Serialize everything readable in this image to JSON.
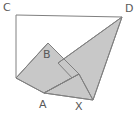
{
  "figure": {
    "background_color": "#ffffff",
    "fill_color": "#c8c8c8",
    "fill_color_dark": "#bdbdbd",
    "stroke_color": "#808080",
    "label_color": "#595959",
    "stroke_width": 1,
    "width": 139,
    "height": 120
  },
  "labels": {
    "c": "C",
    "d": "D",
    "a": "A",
    "b": "B",
    "x": "X"
  },
  "points": {
    "C": [
      16,
      15
    ],
    "D": [
      122,
      17
    ],
    "L": [
      16,
      78
    ],
    "B": [
      48,
      43
    ],
    "A": [
      44,
      93
    ],
    "X": [
      80,
      101
    ],
    "R": [
      93,
      100
    ],
    "I": [
      73,
      68
    ],
    "M": [
      79,
      74
    ]
  },
  "shapes": {
    "rectangle_path": "M16,15 L122,17 L122,100 L16,78 Z",
    "quad_left_path": "M16,78 L48,43 L79,74 L44,93 Z",
    "triangle_d_path": "M122,17 L93,100 L58,63 Z",
    "triangle_bottom_path": "M44,93 L93,100 L79,74 Z",
    "lines": [
      "M16,15 L122,17",
      "M16,15 L16,78",
      "M16,78 L48,43",
      "M48,43 L79,74",
      "M79,74 L44,93",
      "M16,78 L44,93",
      "M44,93 L93,100",
      "M93,100 L122,17",
      "M122,17 L58,63",
      "M79,74 L93,100",
      "M44,93 L79,74"
    ]
  }
}
